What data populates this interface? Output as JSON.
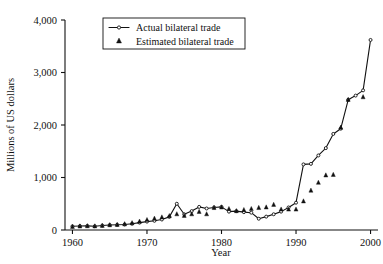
{
  "chart_data": {
    "type": "line",
    "title": "",
    "xlabel": "Year",
    "ylabel": "Millions of US dollars",
    "xlim": [
      1959,
      2001
    ],
    "ylim": [
      0,
      4000
    ],
    "grid": false,
    "legend_position": "top-center",
    "xticks": [
      1960,
      1970,
      1980,
      1990,
      2000
    ],
    "xtick_labels": [
      "1960",
      "1970",
      "1980",
      "1990",
      "2000"
    ],
    "yticks": [
      0,
      1000,
      2000,
      3000,
      4000
    ],
    "ytick_labels": [
      "0",
      "1,000",
      "2,000",
      "3,000",
      "4,000"
    ],
    "series": [
      {
        "name": "Actual bilateral trade",
        "marker": "open-circle",
        "style": "line",
        "x": [
          1960,
          1961,
          1962,
          1963,
          1964,
          1965,
          1966,
          1967,
          1968,
          1969,
          1970,
          1971,
          1972,
          1973,
          1974,
          1975,
          1976,
          1977,
          1978,
          1979,
          1980,
          1981,
          1982,
          1983,
          1984,
          1985,
          1986,
          1987,
          1988,
          1989,
          1990,
          1991,
          1992,
          1993,
          1994,
          1995,
          1996,
          1997,
          1998,
          1999,
          2000
        ],
        "values": [
          70,
          75,
          78,
          72,
          85,
          95,
          100,
          105,
          120,
          140,
          160,
          175,
          200,
          250,
          500,
          300,
          360,
          440,
          410,
          430,
          440,
          350,
          360,
          340,
          330,
          215,
          255,
          300,
          350,
          430,
          520,
          1250,
          1260,
          1420,
          1560,
          1830,
          1930,
          2480,
          2560,
          2660,
          3620
        ]
      },
      {
        "name": "Estimated bilateral trade",
        "marker": "filled-triangle",
        "style": "scatter",
        "x": [
          1960,
          1961,
          1962,
          1963,
          1964,
          1965,
          1966,
          1967,
          1968,
          1969,
          1970,
          1971,
          1972,
          1973,
          1974,
          1975,
          1976,
          1977,
          1978,
          1979,
          1980,
          1981,
          1982,
          1983,
          1984,
          1985,
          1986,
          1987,
          1988,
          1989,
          1990,
          1991,
          1992,
          1993,
          1994,
          1995,
          1996,
          1997,
          1999
        ],
        "values": [
          60,
          68,
          72,
          70,
          80,
          92,
          98,
          110,
          130,
          160,
          190,
          215,
          240,
          265,
          300,
          270,
          300,
          345,
          300,
          420,
          430,
          400,
          360,
          380,
          400,
          420,
          430,
          480,
          390,
          390,
          390,
          545,
          750,
          900,
          1040,
          1050,
          1950,
          2480,
          2530
        ]
      }
    ]
  },
  "legend": {
    "items": [
      {
        "label": "Actual bilateral trade",
        "marker": "open-circle"
      },
      {
        "label": "Estimated bilateral trade",
        "marker": "filled-triangle"
      }
    ]
  },
  "axes": {
    "x_title": "Year",
    "y_title": "Millions of US dollars"
  }
}
